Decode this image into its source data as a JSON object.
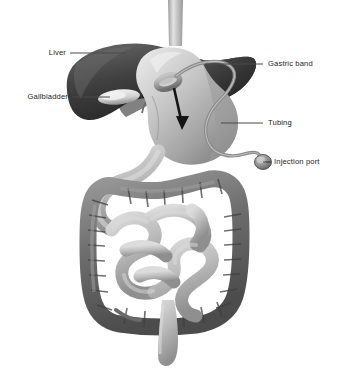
{
  "figure": {
    "background_color": "#ffffff",
    "label_color": "#1c1c1c",
    "leader_line_color": "#4a4a4a"
  },
  "labels": {
    "liver": "Liver",
    "gallbladder": "Gallbladder",
    "gastric_band": "Gastric band",
    "tubing": "Tubing",
    "injection_port": "Injection port"
  },
  "structures": {
    "esophagus": "esophagus",
    "liver": "liver",
    "gallbladder": "gallbladder",
    "stomach": "stomach",
    "duodenum": "duodenum",
    "small_intestine": "small-intestine",
    "large_intestine": "large-intestine",
    "rectum": "rectum",
    "gastric_band": "gastric-band",
    "tubing": "tubing",
    "injection_port": "injection-port",
    "flow_arrow": "flow-arrow"
  },
  "colors": {
    "liver_dark": "#3b3b3b",
    "liver_mid": "#545454",
    "gallbladder": "#d8d8d8",
    "stomach_light": "#cfcfcf",
    "stomach_mid": "#a8a8a8",
    "small_intestine": "#b9b9b9",
    "large_intestine": "#6f6f6f",
    "band": "#9a9a9a",
    "port": "#8a8a8a"
  }
}
